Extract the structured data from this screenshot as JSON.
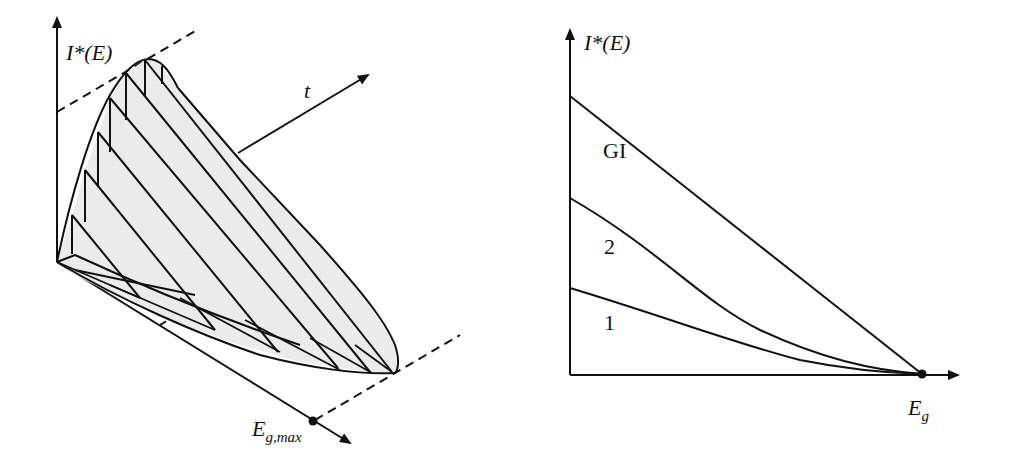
{
  "left_panel": {
    "y_axis_label": "I*(E)",
    "time_axis_label": "t",
    "x_axis_label_main": "E",
    "x_axis_label_sub": "g,max"
  },
  "right_panel": {
    "y_axis_label": "I*(E)",
    "x_axis_label_main": "E",
    "x_axis_label_sub": "g",
    "curves": [
      {
        "label": "GI",
        "start_y": 96,
        "shape": "linear"
      },
      {
        "label": "2",
        "start_y": 198,
        "shape": "concave"
      },
      {
        "label": "1",
        "start_y": 288,
        "shape": "concave"
      }
    ]
  },
  "colors": {
    "line": "#111111",
    "fill": "#ececec"
  }
}
